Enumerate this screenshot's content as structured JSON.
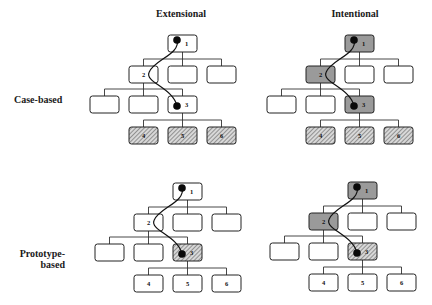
{
  "columns": [
    {
      "key": "extensional",
      "title": "Extensional"
    },
    {
      "key": "intentional",
      "title": "Intentional"
    }
  ],
  "rows": [
    {
      "key": "case-based",
      "title_lines": [
        "Case-based"
      ]
    },
    {
      "key": "prototype-based",
      "title_lines": [
        "Prototype-",
        "based"
      ]
    }
  ],
  "legend_styles": {
    "plain": "#ffffff",
    "gray": "#9a9a9a",
    "hatched": "hatched"
  },
  "diagrams": [
    {
      "name": "case-based-extensional",
      "row": "case-based",
      "column": "extensional",
      "nodes": [
        {
          "id": "n1",
          "level": 0,
          "slot": 2,
          "label": "1",
          "style": "plain",
          "marker": true
        },
        {
          "id": "n2",
          "level": 1,
          "slot": 1,
          "label": "2",
          "style": "plain",
          "marker": false
        },
        {
          "id": "a2",
          "level": 1,
          "slot": 2,
          "label": "",
          "style": "plain",
          "marker": false
        },
        {
          "id": "b2",
          "level": 1,
          "slot": 3,
          "label": "",
          "style": "plain",
          "marker": false
        },
        {
          "id": "a3",
          "level": 2,
          "slot": 0,
          "label": "",
          "style": "plain",
          "marker": false
        },
        {
          "id": "b3",
          "level": 2,
          "slot": 1,
          "label": "",
          "style": "plain",
          "marker": false
        },
        {
          "id": "n3",
          "level": 2,
          "slot": 2,
          "label": "3",
          "style": "plain",
          "marker": true
        },
        {
          "id": "n4",
          "level": 3,
          "slot": 1,
          "label": "4",
          "style": "hatched",
          "marker": false
        },
        {
          "id": "n5",
          "level": 3,
          "slot": 2,
          "label": "5",
          "style": "hatched",
          "marker": false
        },
        {
          "id": "n6",
          "level": 3,
          "slot": 3,
          "label": "6",
          "style": "hatched",
          "marker": false
        }
      ]
    },
    {
      "name": "case-based-intentional",
      "row": "case-based",
      "column": "intentional",
      "nodes": [
        {
          "id": "n1",
          "level": 0,
          "slot": 2,
          "label": "1",
          "style": "gray",
          "marker": true
        },
        {
          "id": "n2",
          "level": 1,
          "slot": 1,
          "label": "2",
          "style": "gray",
          "marker": false
        },
        {
          "id": "a2",
          "level": 1,
          "slot": 2,
          "label": "",
          "style": "plain",
          "marker": false
        },
        {
          "id": "b2",
          "level": 1,
          "slot": 3,
          "label": "",
          "style": "plain",
          "marker": false
        },
        {
          "id": "a3",
          "level": 2,
          "slot": 0,
          "label": "",
          "style": "plain",
          "marker": false
        },
        {
          "id": "b3",
          "level": 2,
          "slot": 1,
          "label": "",
          "style": "plain",
          "marker": false
        },
        {
          "id": "n3",
          "level": 2,
          "slot": 2,
          "label": "3",
          "style": "gray",
          "marker": true
        },
        {
          "id": "n4",
          "level": 3,
          "slot": 1,
          "label": "4",
          "style": "hatched",
          "marker": false
        },
        {
          "id": "n5",
          "level": 3,
          "slot": 2,
          "label": "5",
          "style": "hatched",
          "marker": false
        },
        {
          "id": "n6",
          "level": 3,
          "slot": 3,
          "label": "6",
          "style": "hatched",
          "marker": false
        }
      ]
    },
    {
      "name": "prototype-based-extensional",
      "row": "prototype-based",
      "column": "extensional",
      "nodes": [
        {
          "id": "n1",
          "level": 0,
          "slot": 2,
          "label": "1",
          "style": "plain",
          "marker": true
        },
        {
          "id": "n2",
          "level": 1,
          "slot": 1,
          "label": "2",
          "style": "plain",
          "marker": false
        },
        {
          "id": "a2",
          "level": 1,
          "slot": 2,
          "label": "",
          "style": "plain",
          "marker": false
        },
        {
          "id": "b2",
          "level": 1,
          "slot": 3,
          "label": "",
          "style": "plain",
          "marker": false
        },
        {
          "id": "a3",
          "level": 2,
          "slot": 0,
          "label": "",
          "style": "plain",
          "marker": false
        },
        {
          "id": "b3",
          "level": 2,
          "slot": 1,
          "label": "",
          "style": "plain",
          "marker": false
        },
        {
          "id": "n3",
          "level": 2,
          "slot": 2,
          "label": "3",
          "style": "hatched",
          "marker": true
        },
        {
          "id": "n4",
          "level": 3,
          "slot": 1,
          "label": "4",
          "style": "plain",
          "marker": false
        },
        {
          "id": "n5",
          "level": 3,
          "slot": 2,
          "label": "5",
          "style": "plain",
          "marker": false
        },
        {
          "id": "n6",
          "level": 3,
          "slot": 3,
          "label": "6",
          "style": "plain",
          "marker": false
        }
      ]
    },
    {
      "name": "prototype-based-intentional",
      "row": "prototype-based",
      "column": "intentional",
      "nodes": [
        {
          "id": "n1",
          "level": 0,
          "slot": 2,
          "label": "1",
          "style": "gray",
          "marker": true
        },
        {
          "id": "n2",
          "level": 1,
          "slot": 1,
          "label": "2",
          "style": "gray",
          "marker": false
        },
        {
          "id": "a2",
          "level": 1,
          "slot": 2,
          "label": "",
          "style": "plain",
          "marker": false
        },
        {
          "id": "b2",
          "level": 1,
          "slot": 3,
          "label": "",
          "style": "plain",
          "marker": false
        },
        {
          "id": "a3",
          "level": 2,
          "slot": 0,
          "label": "",
          "style": "plain",
          "marker": false
        },
        {
          "id": "b3",
          "level": 2,
          "slot": 1,
          "label": "",
          "style": "plain",
          "marker": false
        },
        {
          "id": "n3",
          "level": 2,
          "slot": 2,
          "label": "3",
          "style": "hatched",
          "marker": true
        },
        {
          "id": "n4",
          "level": 3,
          "slot": 1,
          "label": "4",
          "style": "plain",
          "marker": false
        },
        {
          "id": "n5",
          "level": 3,
          "slot": 2,
          "label": "5",
          "style": "plain",
          "marker": false
        },
        {
          "id": "n6",
          "level": 3,
          "slot": 3,
          "label": "6",
          "style": "plain",
          "marker": false
        }
      ]
    }
  ],
  "edges": [
    {
      "parent": "n1",
      "children": [
        "n2",
        "a2",
        "b2"
      ]
    },
    {
      "parent": "n2",
      "children": [
        "a3",
        "b3",
        "n3"
      ]
    },
    {
      "parent": "n3",
      "children": [
        "n4",
        "n5",
        "n6"
      ]
    }
  ],
  "traversal_path": [
    "n1",
    "n2",
    "n3"
  ]
}
